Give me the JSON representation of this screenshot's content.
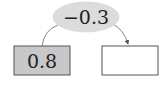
{
  "diagram": {
    "operator": {
      "label": "−0.3",
      "fill": "#dcdcdc"
    },
    "input_box": {
      "value": "0.8",
      "fill": "#c8c8c8"
    },
    "output_box": {
      "value": "",
      "fill": "#ffffff"
    },
    "arrow": {
      "from": "input_box",
      "to": "output_box",
      "via": "operator"
    },
    "colors": {
      "stroke": "#555555",
      "text": "#222222"
    }
  }
}
